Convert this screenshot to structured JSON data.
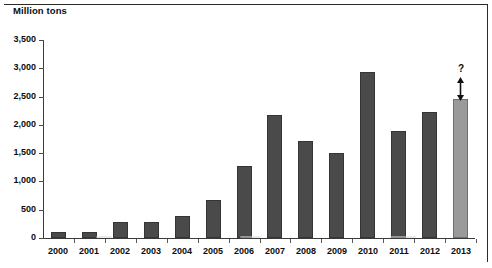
{
  "chart_data": {
    "type": "bar",
    "title": "",
    "ylabel": "Million tons",
    "xlabel": "",
    "ylim": [
      0,
      3500
    ],
    "ytick_step": 500,
    "grid": false,
    "legend": null,
    "categories": [
      "2000",
      "2001",
      "2002",
      "2003",
      "2004",
      "2005",
      "2006",
      "2007",
      "2008",
      "2009",
      "2010",
      "2011",
      "2012",
      "2013"
    ],
    "values": [
      100,
      100,
      290,
      285,
      385,
      680,
      1270,
      2170,
      1720,
      1510,
      2930,
      1900,
      2230,
      2450
    ],
    "ytick_labels": [
      "0",
      "500",
      "1,000",
      "1,500",
      "2,000",
      "2,500",
      "3,000",
      "3,500"
    ],
    "ytick_values": [
      0,
      500,
      1000,
      1500,
      2000,
      2500,
      3000,
      3500
    ],
    "series": [
      {
        "name": "Million tons",
        "values": [
          100,
          100,
          290,
          285,
          385,
          680,
          1270,
          2170,
          1720,
          1510,
          2930,
          1900,
          2230,
          2450
        ]
      }
    ],
    "annotations": [
      {
        "label": "?",
        "category": "2013",
        "type": "uncertainty-arrow",
        "note": "double-headed vertical arrow above the 2013 bar"
      }
    ],
    "bar_styles": {
      "actual_color": "#4a4a4a",
      "forecast_color": "#9a9a9a",
      "forecast_categories": [
        "2013"
      ]
    }
  },
  "colors": {
    "bar_actual": "#4a4a4a",
    "bar_forecast": "#9a9a9a",
    "axis": "#3a3a3a",
    "text": "#0d0d0d"
  }
}
